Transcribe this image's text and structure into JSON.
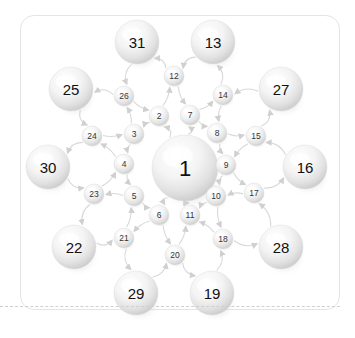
{
  "figure": {
    "kind": "radial-network-graph",
    "background_color": "#ffffff",
    "card_border_color": "#e4e4e4",
    "separator_style": "dashed",
    "separator_color": "#cfcfcf",
    "node_fill_light": "#ffffff",
    "node_fill_shade": "#d5d5d5",
    "edge_color": "#d9d9d9",
    "label_color": "#111111"
  },
  "nodes": [
    {
      "id": "1",
      "label": "1",
      "x": 185,
      "y": 168,
      "r": 33,
      "tier": "hub"
    },
    {
      "id": "2",
      "label": "2",
      "x": 159,
      "y": 116,
      "r": 10,
      "tier": "small"
    },
    {
      "id": "3",
      "label": "3",
      "x": 134,
      "y": 134,
      "r": 10,
      "tier": "small"
    },
    {
      "id": "4",
      "label": "4",
      "x": 124,
      "y": 164,
      "r": 10,
      "tier": "small"
    },
    {
      "id": "5",
      "label": "5",
      "x": 134,
      "y": 196,
      "r": 10,
      "tier": "small"
    },
    {
      "id": "6",
      "label": "6",
      "x": 159,
      "y": 215,
      "r": 10,
      "tier": "small"
    },
    {
      "id": "7",
      "label": "7",
      "x": 190,
      "y": 115,
      "r": 10,
      "tier": "small"
    },
    {
      "id": "8",
      "label": "8",
      "x": 217,
      "y": 133,
      "r": 10,
      "tier": "small"
    },
    {
      "id": "9",
      "label": "9",
      "x": 226,
      "y": 165,
      "r": 10,
      "tier": "small"
    },
    {
      "id": "10",
      "label": "10",
      "x": 216,
      "y": 196,
      "r": 10,
      "tier": "small"
    },
    {
      "id": "11",
      "label": "11",
      "x": 190,
      "y": 215,
      "r": 10,
      "tier": "small"
    },
    {
      "id": "12",
      "label": "12",
      "x": 174,
      "y": 76,
      "r": 10,
      "tier": "small"
    },
    {
      "id": "13",
      "label": "13",
      "x": 213,
      "y": 42,
      "r": 22,
      "tier": "big"
    },
    {
      "id": "14",
      "label": "14",
      "x": 223,
      "y": 95,
      "r": 10,
      "tier": "small"
    },
    {
      "id": "15",
      "label": "15",
      "x": 256,
      "y": 136,
      "r": 10,
      "tier": "small"
    },
    {
      "id": "16",
      "label": "16",
      "x": 305,
      "y": 167,
      "r": 22,
      "tier": "big"
    },
    {
      "id": "17",
      "label": "17",
      "x": 254,
      "y": 193,
      "r": 10,
      "tier": "small"
    },
    {
      "id": "18",
      "label": "18",
      "x": 223,
      "y": 239,
      "r": 10,
      "tier": "small"
    },
    {
      "id": "19",
      "label": "19",
      "x": 212,
      "y": 293,
      "r": 22,
      "tier": "big"
    },
    {
      "id": "20",
      "label": "20",
      "x": 175,
      "y": 255,
      "r": 10,
      "tier": "small"
    },
    {
      "id": "21",
      "label": "21",
      "x": 124,
      "y": 238,
      "r": 10,
      "tier": "small"
    },
    {
      "id": "22",
      "label": "22",
      "x": 74,
      "y": 247,
      "r": 22,
      "tier": "big"
    },
    {
      "id": "23",
      "label": "23",
      "x": 94,
      "y": 194,
      "r": 10,
      "tier": "small"
    },
    {
      "id": "24",
      "label": "24",
      "x": 92,
      "y": 136,
      "r": 10,
      "tier": "small"
    },
    {
      "id": "25",
      "label": "25",
      "x": 71,
      "y": 89,
      "r": 22,
      "tier": "big"
    },
    {
      "id": "26",
      "label": "26",
      "x": 124,
      "y": 96,
      "r": 10,
      "tier": "small"
    },
    {
      "id": "27",
      "label": "27",
      "x": 281,
      "y": 89,
      "r": 22,
      "tier": "big"
    },
    {
      "id": "28",
      "label": "28",
      "x": 281,
      "y": 247,
      "r": 22,
      "tier": "big"
    },
    {
      "id": "29",
      "label": "29",
      "x": 136,
      "y": 293,
      "r": 22,
      "tier": "big"
    },
    {
      "id": "30",
      "label": "30",
      "x": 48,
      "y": 167,
      "r": 22,
      "tier": "big"
    },
    {
      "id": "31",
      "label": "31",
      "x": 137,
      "y": 42,
      "r": 22,
      "tier": "big"
    }
  ],
  "edges": [
    {
      "from": "1",
      "to": "2"
    },
    {
      "from": "1",
      "to": "7"
    },
    {
      "from": "1",
      "to": "6"
    },
    {
      "from": "1",
      "to": "11"
    },
    {
      "from": "2",
      "to": "3"
    },
    {
      "from": "3",
      "to": "4"
    },
    {
      "from": "4",
      "to": "5"
    },
    {
      "from": "5",
      "to": "6"
    },
    {
      "from": "7",
      "to": "8"
    },
    {
      "from": "8",
      "to": "9"
    },
    {
      "from": "9",
      "to": "10"
    },
    {
      "from": "10",
      "to": "11"
    },
    {
      "from": "2",
      "to": "12"
    },
    {
      "from": "12",
      "to": "7"
    },
    {
      "from": "6",
      "to": "20"
    },
    {
      "from": "20",
      "to": "11"
    },
    {
      "from": "12",
      "to": "31"
    },
    {
      "from": "31",
      "to": "26"
    },
    {
      "from": "26",
      "to": "2"
    },
    {
      "from": "26",
      "to": "25"
    },
    {
      "from": "25",
      "to": "24"
    },
    {
      "from": "24",
      "to": "3"
    },
    {
      "from": "24",
      "to": "30"
    },
    {
      "from": "30",
      "to": "23"
    },
    {
      "from": "23",
      "to": "4"
    },
    {
      "from": "23",
      "to": "22"
    },
    {
      "from": "22",
      "to": "21"
    },
    {
      "from": "21",
      "to": "5"
    },
    {
      "from": "21",
      "to": "29"
    },
    {
      "from": "29",
      "to": "20"
    },
    {
      "from": "20",
      "to": "19"
    },
    {
      "from": "19",
      "to": "18"
    },
    {
      "from": "18",
      "to": "11"
    },
    {
      "from": "18",
      "to": "28"
    },
    {
      "from": "28",
      "to": "17"
    },
    {
      "from": "17",
      "to": "10"
    },
    {
      "from": "17",
      "to": "16"
    },
    {
      "from": "16",
      "to": "15"
    },
    {
      "from": "15",
      "to": "9"
    },
    {
      "from": "15",
      "to": "27"
    },
    {
      "from": "27",
      "to": "14"
    },
    {
      "from": "14",
      "to": "8"
    },
    {
      "from": "14",
      "to": "13"
    },
    {
      "from": "13",
      "to": "12"
    },
    {
      "from": "3",
      "to": "26"
    },
    {
      "from": "4",
      "to": "24"
    },
    {
      "from": "5",
      "to": "23"
    },
    {
      "from": "6",
      "to": "21"
    },
    {
      "from": "8",
      "to": "15"
    },
    {
      "from": "9",
      "to": "17"
    },
    {
      "from": "10",
      "to": "18"
    },
    {
      "from": "7",
      "to": "14"
    }
  ]
}
